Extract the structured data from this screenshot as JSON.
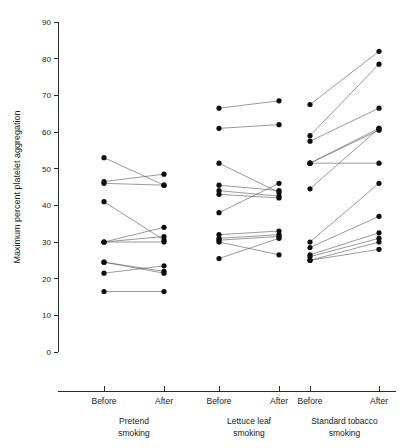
{
  "chart_data": {
    "type": "line",
    "title": "",
    "xlabel": "",
    "ylabel": "Maximum percent platelet aggregation",
    "ylim": [
      0,
      90
    ],
    "ytick_labels": [
      "0",
      "10",
      "20",
      "30",
      "40",
      "50",
      "60",
      "70",
      "80",
      "90"
    ],
    "ytick_values": [
      0,
      10,
      20,
      30,
      40,
      50,
      60,
      70,
      80,
      90
    ],
    "grid": false,
    "legend": "none",
    "x_categories": [
      "Before",
      "After"
    ],
    "groups": [
      {
        "label_line1": "Pretend",
        "label_line2": "smoking",
        "xtick_labels": [
          "Before",
          "After"
        ],
        "pairs": [
          {
            "before": 53.0,
            "after": 45.5
          },
          {
            "before": 46.5,
            "after": 48.5
          },
          {
            "before": 46.0,
            "after": 45.5
          },
          {
            "before": 41.0,
            "after": 30.5
          },
          {
            "before": 30.0,
            "after": 34.0
          },
          {
            "before": 30.0,
            "after": 31.5
          },
          {
            "before": 30.0,
            "after": 30.0
          },
          {
            "before": 24.5,
            "after": 22.0
          },
          {
            "before": 24.5,
            "after": 21.5
          },
          {
            "before": 21.5,
            "after": 23.5
          },
          {
            "before": 16.5,
            "after": 16.5
          }
        ]
      },
      {
        "label_line1": "Lettuce leaf",
        "label_line2": "smoking",
        "xtick_labels": [
          "Before",
          "After"
        ],
        "pairs": [
          {
            "before": 66.5,
            "after": 68.5
          },
          {
            "before": 61.0,
            "after": 62.0
          },
          {
            "before": 51.5,
            "after": 43.5
          },
          {
            "before": 45.5,
            "after": 44.0
          },
          {
            "before": 44.0,
            "after": 42.5
          },
          {
            "before": 43.0,
            "after": 42.0
          },
          {
            "before": 38.0,
            "after": 46.0
          },
          {
            "before": 32.0,
            "after": 33.0
          },
          {
            "before": 31.0,
            "after": 32.0
          },
          {
            "before": 30.5,
            "after": 31.5
          },
          {
            "before": 30.0,
            "after": 26.5
          },
          {
            "before": 25.5,
            "after": 31.0
          }
        ]
      },
      {
        "label_line1": "Standard tobacco",
        "label_line2": "smoking",
        "xtick_labels": [
          "Before",
          "After"
        ],
        "pairs": [
          {
            "before": 67.5,
            "after": 82.0
          },
          {
            "before": 59.0,
            "after": 78.5
          },
          {
            "before": 57.5,
            "after": 66.5
          },
          {
            "before": 51.5,
            "after": 61.0
          },
          {
            "before": 51.5,
            "after": 60.5
          },
          {
            "before": 51.5,
            "after": 51.5
          },
          {
            "before": 44.5,
            "after": 61.0
          },
          {
            "before": 30.0,
            "after": 46.0
          },
          {
            "before": 28.5,
            "after": 37.0
          },
          {
            "before": 26.5,
            "after": 32.5
          },
          {
            "before": 26.0,
            "after": 31.0
          },
          {
            "before": 25.0,
            "after": 30.0
          },
          {
            "before": 25.0,
            "after": 28.0
          }
        ]
      }
    ]
  }
}
